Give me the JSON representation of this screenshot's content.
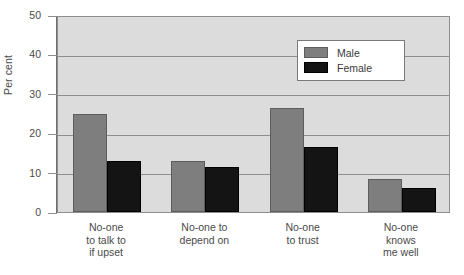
{
  "chart_data": {
    "type": "bar",
    "title": "",
    "xlabel": "",
    "ylabel": "Per cent",
    "ylim": [
      0,
      50
    ],
    "yticks": [
      0,
      10,
      20,
      30,
      40,
      50
    ],
    "grid": true,
    "legend_position": "top-right",
    "categories": [
      "No-one\nto talk to\nif upset",
      "No-one to\ndepend on",
      "No-one\nto trust",
      "No-one\nknows\nme well"
    ],
    "series": [
      {
        "name": "Male",
        "color": "#7e7e7e",
        "values": [
          25.0,
          13.0,
          26.5,
          8.5
        ]
      },
      {
        "name": "Female",
        "color": "#141414",
        "values": [
          13.0,
          11.5,
          16.5,
          6.0
        ]
      }
    ]
  },
  "caption": {
    "text": ""
  }
}
